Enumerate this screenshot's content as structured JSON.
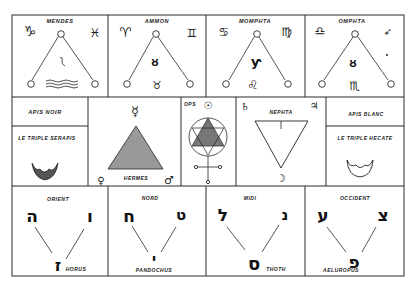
{
  "figure": {
    "row1": [
      {
        "label": "MENDES",
        "left_sign": "♑",
        "right_sign": "♓",
        "center_glyph": "ʃ",
        "bottom_glyph": "≈"
      },
      {
        "label": "AMMON",
        "left_sign": "♈",
        "right_sign": "♊",
        "center_glyph": "ᴕ",
        "bottom_glyph": "♉"
      },
      {
        "label": "MOMPHTA",
        "left_sign": "♋",
        "right_sign": "♍",
        "center_glyph": "ƴ",
        "bottom_glyph": "♌"
      },
      {
        "label": "OMPHTA",
        "left_sign": "♎",
        "right_sign": "➶",
        "center_glyph": "ᴕ",
        "bottom_glyph": "♏"
      }
    ],
    "row2": {
      "apis_noir": "APIS NOIR",
      "triple_serapis": "LE TRIPLE SERAPIS",
      "hermes": {
        "label": "HERMES",
        "top_sign": "☿",
        "left_sign": "♀",
        "right_sign": "♂"
      },
      "ops": {
        "label": "OPS",
        "top_sign": "☉",
        "bottom_sign": "♀"
      },
      "nephta": {
        "label": "NEPHTA",
        "left_sign": "♄",
        "right_sign": "♃",
        "bottom_sign": "☽"
      },
      "apis_blanc": "APIS BLANC",
      "triple_hecate": "LE TRIPLE HECATE"
    },
    "row3": [
      {
        "label": "ORIENT",
        "left_letter": "ה",
        "right_letter": "ו",
        "bottom_letter": "ז",
        "name": "HORUS"
      },
      {
        "label": "NORD",
        "left_letter": "ח",
        "right_letter": "ט",
        "bottom_letter": "י",
        "name": "PANDOCHUS"
      },
      {
        "label": "MIDI",
        "left_letter": "ל",
        "right_letter": "נ",
        "bottom_letter": "ס",
        "name": "THOTH"
      },
      {
        "label": "OCCIDENT",
        "left_letter": "ע",
        "right_letter": "צ",
        "bottom_letter": "פ",
        "name": "AELUROPUS"
      }
    ]
  }
}
